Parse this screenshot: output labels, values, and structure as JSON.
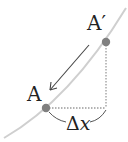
{
  "diagram": {
    "labels": {
      "point_a": "A",
      "point_a_prime": "A′",
      "delta": "Δ",
      "delta_var": "x"
    },
    "colors": {
      "curve": "#cfcfcf",
      "point": "#808080",
      "arrow": "#444444",
      "dotted": "#9a9a9a",
      "text": "#222222"
    }
  }
}
